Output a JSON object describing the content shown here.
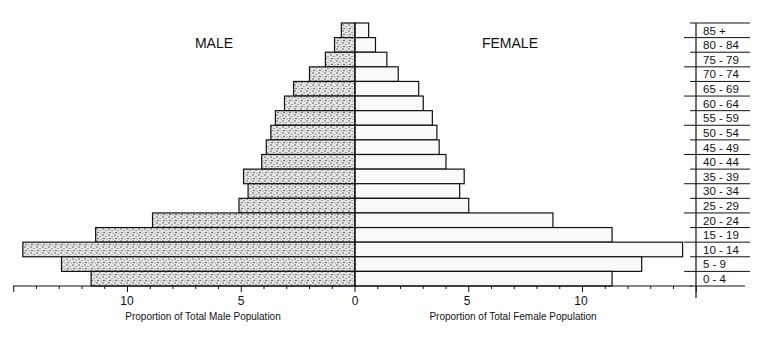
{
  "chart_data": {
    "type": "bar",
    "subtype": "population-pyramid",
    "title": "",
    "categories": [
      "85 +",
      "80 - 84",
      "75 - 79",
      "70 - 74",
      "65 - 69",
      "60 - 64",
      "55 - 59",
      "50 - 54",
      "45 - 49",
      "40 - 44",
      "35 - 39",
      "30 - 34",
      "25 - 29",
      "20 - 24",
      "15 - 19",
      "10 - 14",
      "5 - 9",
      "0 - 4"
    ],
    "series": [
      {
        "name": "MALE",
        "values": [
          0.6,
          0.9,
          1.3,
          2.0,
          2.7,
          3.1,
          3.5,
          3.7,
          3.9,
          4.1,
          4.9,
          4.7,
          5.1,
          8.9,
          11.4,
          14.6,
          12.9,
          11.6
        ]
      },
      {
        "name": "FEMALE",
        "values": [
          0.6,
          0.9,
          1.4,
          1.9,
          2.8,
          3.0,
          3.4,
          3.6,
          3.7,
          4.0,
          4.8,
          4.6,
          5.0,
          8.7,
          11.3,
          14.4,
          12.6,
          11.3
        ]
      }
    ],
    "xlabel_left": "Proportion of Total Male Population",
    "xlabel_right": "Proportion of Total Female Population",
    "ylabel": "",
    "x_ticks": [
      0,
      5,
      10
    ],
    "xlim": [
      0,
      15
    ],
    "grid": false,
    "legend": {
      "left_label": "MALE",
      "right_label": "FEMALE",
      "position": "top"
    }
  },
  "labels": {
    "male": "MALE",
    "female": "FEMALE",
    "xlabel_left": "Proportion of Total Male Population",
    "xlabel_right": "Proportion of Total Female Population",
    "tick_10": "10",
    "tick_5": "5",
    "tick_0": "0"
  }
}
